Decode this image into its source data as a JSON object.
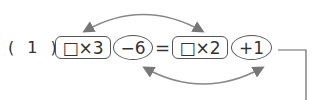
{
  "problem": {
    "label": "( 1 )",
    "terms": [
      {
        "text": "□×3",
        "shape": "box"
      },
      {
        "text": "−6",
        "shape": "oval"
      },
      {
        "text": "=",
        "shape": "none"
      },
      {
        "text": "□×2",
        "shape": "box"
      },
      {
        "text": "+1",
        "shape": "oval"
      }
    ],
    "arrows": [
      {
        "from": "□×3",
        "to": "□×2",
        "position": "top",
        "double_headed": true
      },
      {
        "from": "−6",
        "to": "+1",
        "position": "bottom",
        "double_headed": true
      }
    ],
    "colors": {
      "stroke": "#555555",
      "arrow": "#777777"
    }
  }
}
